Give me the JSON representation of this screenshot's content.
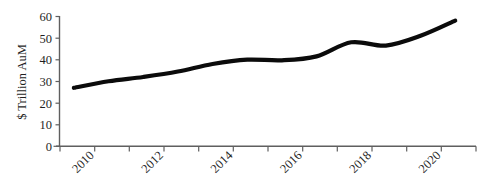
{
  "chart_data": {
    "type": "line",
    "title": "",
    "subtitle": "",
    "xlabel": "",
    "ylabel": "$ Trillion AuM",
    "x": [
      2009,
      2010,
      2011,
      2012,
      2013,
      2014,
      2015,
      2016,
      2017,
      2018,
      2019,
      2020
    ],
    "values": [
      27,
      30,
      32,
      34.5,
      38,
      40,
      39.7,
      41.5,
      48,
      46.5,
      51,
      58
    ],
    "series": [
      {
        "name": "Global Assets under Management",
        "values": [
          27,
          30,
          32,
          34.5,
          38,
          40,
          39.7,
          41.5,
          48,
          46.5,
          51,
          58
        ]
      }
    ],
    "xlim": [
      2008.6,
      2020.6
    ],
    "ylim": [
      0,
      60
    ],
    "ytick_labels": [
      "0",
      "10",
      "20",
      "30",
      "40",
      "50",
      "60"
    ],
    "ytick_values": [
      0,
      10,
      20,
      30,
      40,
      50,
      60
    ],
    "xtick_values": [
      2009,
      2010,
      2011,
      2012,
      2013,
      2014,
      2015,
      2016,
      2017,
      2018,
      2019,
      2020,
      2021
    ],
    "xtick_labels": [
      "",
      "2010",
      "",
      "2012",
      "",
      "2014",
      "",
      "2016",
      "",
      "2018",
      "",
      "2020",
      ""
    ],
    "xtick_label_rotation": -45,
    "grid": false,
    "legend": false,
    "legend_position": "none",
    "line_color": "#0b0b0b",
    "axis_color": "#5f5f5f",
    "background_color": "#ffffff",
    "annotations": []
  },
  "axis": {
    "y_title": "$ Trillion AuM",
    "y_ticks": [
      {
        "label": "60",
        "value": 60
      },
      {
        "label": "50",
        "value": 50
      },
      {
        "label": "40",
        "value": 40
      },
      {
        "label": "30",
        "value": 30
      },
      {
        "label": "20",
        "value": 20
      },
      {
        "label": "10",
        "value": 10
      },
      {
        "label": "0",
        "value": 0
      }
    ],
    "x_ticks": [
      {
        "label": "",
        "value": 2009
      },
      {
        "label": "2010",
        "value": 2010
      },
      {
        "label": "",
        "value": 2011
      },
      {
        "label": "2012",
        "value": 2012
      },
      {
        "label": "",
        "value": 2013
      },
      {
        "label": "2014",
        "value": 2014
      },
      {
        "label": "",
        "value": 2015
      },
      {
        "label": "2016",
        "value": 2016
      },
      {
        "label": "",
        "value": 2017
      },
      {
        "label": "2018",
        "value": 2018
      },
      {
        "label": "",
        "value": 2019
      },
      {
        "label": "2020",
        "value": 2020
      },
      {
        "label": "",
        "value": 2021
      }
    ]
  }
}
